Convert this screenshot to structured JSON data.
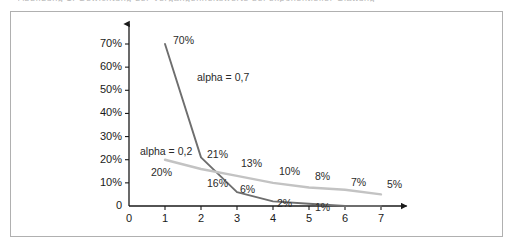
{
  "caption_remnant": "Abbildung 1: Gewichtung der Vergangenheitswerte bei exponentieller Glättung",
  "figure": {
    "border_color": "#b0b0b0",
    "background": "#ffffff"
  },
  "chart_data": {
    "type": "line",
    "title": "",
    "subtitle": "",
    "xlabel": "",
    "ylabel": "",
    "x": [
      1,
      2,
      3,
      4,
      5,
      6,
      7
    ],
    "xlim": [
      0,
      7.6
    ],
    "ylim": [
      0,
      75
    ],
    "x_ticks": [
      "0",
      "1",
      "2",
      "3",
      "4",
      "5",
      "6",
      "7"
    ],
    "x_tick_values": [
      0,
      1,
      2,
      3,
      4,
      5,
      6,
      7
    ],
    "y_ticks": [
      "0",
      "10%",
      "20%",
      "30%",
      "40%",
      "50%",
      "60%",
      "70%"
    ],
    "y_tick_values": [
      0,
      10,
      20,
      30,
      40,
      50,
      60,
      70
    ],
    "grid": false,
    "legend_position": "inline-annotation",
    "axis_style": "arrow-terminated",
    "axis_color": "#1a1a1a",
    "series": [
      {
        "name": "alpha = 0,7",
        "color": "#6e6e6e",
        "values": [
          70,
          21,
          6,
          2,
          1,
          0,
          0
        ],
        "labels": [
          "70%",
          "21%",
          "6%",
          "2%",
          "1%",
          "",
          ""
        ]
      },
      {
        "name": "alpha = 0,2",
        "color": "#c3c3c3",
        "values": [
          20,
          16,
          13,
          10,
          8,
          7,
          5
        ],
        "labels": [
          "20%",
          "16%",
          "13%",
          "10%",
          "8%",
          "7%",
          "5%"
        ]
      }
    ],
    "annotations": [
      {
        "text": "alpha = 0,7",
        "series": "alpha = 0,7"
      },
      {
        "text": "alpha = 0,2",
        "series": "alpha = 0,2"
      }
    ]
  }
}
